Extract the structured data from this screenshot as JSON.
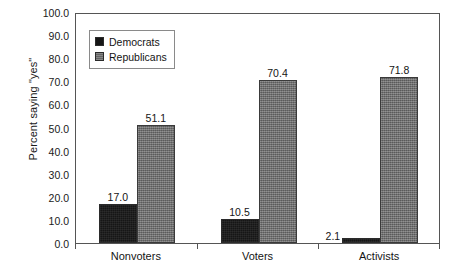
{
  "chart_data": {
    "type": "bar",
    "title": "",
    "subtitle": "",
    "xlabel": "",
    "ylabel": "Percent saying \"yes\"",
    "categories": [
      "Nonvoters",
      "Voters",
      "Activists"
    ],
    "series": [
      {
        "name": "Democrats",
        "values": [
          17.0,
          10.5,
          2.1
        ],
        "color": "#161616"
      },
      {
        "name": "Republicans",
        "values": [
          51.1,
          70.4,
          71.8
        ],
        "color": "#6d6d6d"
      }
    ],
    "value_labels": [
      [
        "17.0",
        "10.5",
        "2.1"
      ],
      [
        "51.1",
        "70.4",
        "71.8"
      ]
    ],
    "ylim": [
      0.0,
      100.0
    ],
    "ytick_step": 10.0,
    "ytick_labels": [
      "100.0",
      "90.0",
      "80.0",
      "70.0",
      "60.0",
      "50.0",
      "40.0",
      "30.0",
      "20.0",
      "10.0",
      "0.0"
    ],
    "ytick_values": [
      100.0,
      90.0,
      80.0,
      70.0,
      60.0,
      50.0,
      40.0,
      30.0,
      20.0,
      10.0,
      0.0
    ],
    "grid": false,
    "legend_position": "upper-left-inside",
    "frame": true
  },
  "legend": {
    "entries": [
      {
        "label": "Democrats",
        "swatch": "dem"
      },
      {
        "label": "Republicans",
        "swatch": "rep"
      }
    ]
  },
  "colors": {
    "democrats": "#161616",
    "republicans": "#6d6d6d",
    "axis": "#555555",
    "text": "#141414",
    "background": "#ffffff"
  }
}
